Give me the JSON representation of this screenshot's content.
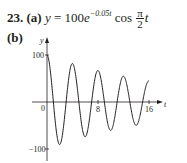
{
  "problem": {
    "number": "23.",
    "part_a_label": "(a)",
    "equation": {
      "lhs": "y",
      "equals": "=",
      "coefficient": "100",
      "base": "e",
      "exponent": "−0.05t",
      "func": "cos",
      "frac_numerator": "π",
      "frac_denominator": "2",
      "var": "t"
    },
    "part_b_label": "(b)"
  },
  "chart_data": {
    "type": "line",
    "title": "",
    "function": "y = 100 e^(-0.05t) cos(π t / 2)",
    "xlabel": "t",
    "ylabel": "y",
    "xlim": [
      0,
      16
    ],
    "ylim": [
      -100,
      100
    ],
    "x_ticks": [
      0,
      8,
      16
    ],
    "x_tick_labels": [
      "0",
      "8",
      "16"
    ],
    "y_ticks": [
      100,
      -100
    ],
    "y_tick_labels": [
      "100",
      "−100"
    ],
    "grid": false,
    "legend": null,
    "series": [
      {
        "name": "y(t)",
        "x": [
          0,
          1,
          2,
          3,
          4,
          5,
          6,
          7,
          8,
          9,
          10,
          11,
          12,
          13,
          14,
          15,
          16
        ],
        "values": [
          100,
          0,
          -90.5,
          0,
          81.9,
          0,
          -74.1,
          0,
          67.0,
          0,
          -60.7,
          0,
          54.9,
          0,
          -49.7,
          0,
          44.9
        ]
      }
    ],
    "annotations": []
  }
}
